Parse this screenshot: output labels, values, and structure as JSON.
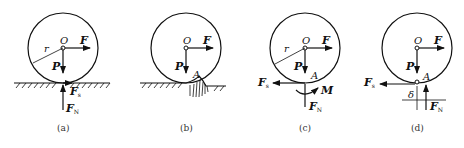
{
  "figure": {
    "panels": [
      {
        "id": "a",
        "caption": "(a)",
        "labels": {
          "center": "O",
          "radius": "r",
          "force_applied": "F",
          "weight": "P",
          "friction": "F",
          "friction_sub": "s",
          "normal": "F",
          "normal_sub": "N"
        }
      },
      {
        "id": "b",
        "caption": "(b)",
        "labels": {
          "center": "O",
          "force_applied": "F",
          "weight": "P",
          "contact": "A"
        }
      },
      {
        "id": "c",
        "caption": "(c)",
        "labels": {
          "center": "O",
          "radius": "r",
          "force_applied": "F",
          "weight": "P",
          "contact": "A",
          "friction": "F",
          "friction_sub": "s",
          "moment": "M",
          "normal": "F",
          "normal_sub": "N"
        }
      },
      {
        "id": "d",
        "caption": "(d)",
        "labels": {
          "center": "O",
          "force_applied": "F",
          "weight": "P",
          "contact": "A",
          "friction": "F",
          "friction_sub": "s",
          "offset": "δ",
          "normal": "F",
          "normal_sub": "N"
        }
      }
    ]
  }
}
